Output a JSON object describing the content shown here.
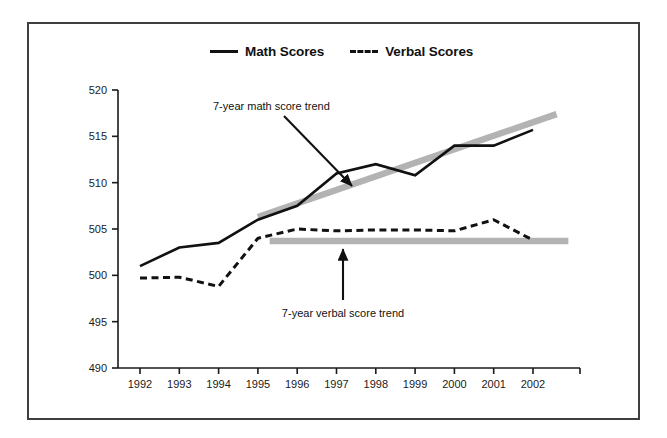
{
  "figure": {
    "border_color": "#3f3f42",
    "background": "#ffffff"
  },
  "legend": {
    "position": "top-center",
    "entries": [
      {
        "label": "Math Scores",
        "marker": "solid-line-swatch",
        "color": "#111111"
      },
      {
        "label": "Verbal Scores",
        "marker": "dashed-line-swatch",
        "color": "#111111"
      }
    ]
  },
  "annotations": [
    {
      "text": "7-year math score trend",
      "target": "math-trend-line"
    },
    {
      "text": "7-year verbal score trend",
      "target": "verbal-trend-line"
    }
  ],
  "axes": {
    "y_ticks": [
      "520",
      "515",
      "510",
      "505",
      "500",
      "495",
      "490"
    ],
    "x_ticks": [
      "1992",
      "1993",
      "1994",
      "1995",
      "1996",
      "1997",
      "1998",
      "1999",
      "2000",
      "2001",
      "2002"
    ]
  },
  "chart_data": {
    "type": "line",
    "title": "",
    "xlabel": "",
    "ylabel": "",
    "categories": [
      "1992",
      "1993",
      "1994",
      "1995",
      "1996",
      "1997",
      "1998",
      "1999",
      "2000",
      "2001",
      "2002"
    ],
    "x": [
      1992,
      1993,
      1994,
      1995,
      1996,
      1997,
      1998,
      1999,
      2000,
      2001,
      2002
    ],
    "ylim": [
      490,
      520
    ],
    "ytick_step": 5,
    "xlim": [
      1992,
      2002
    ],
    "grid": false,
    "legend_position": "top-center",
    "series": [
      {
        "name": "Math Scores",
        "style": "solid",
        "color": "#111111",
        "values": [
          501,
          503,
          503.5,
          506,
          507.5,
          511,
          512,
          510.8,
          514,
          514,
          515.7
        ]
      },
      {
        "name": "Verbal Scores",
        "style": "dashed",
        "color": "#111111",
        "values": [
          499.7,
          499.8,
          498.8,
          504,
          505,
          504.8,
          504.9,
          504.9,
          504.8,
          506,
          503.8
        ]
      }
    ],
    "trend_lines": [
      {
        "name": "7-year math score trend",
        "color": "#b3b3b3",
        "style": "thick-solid",
        "x_start": 1995,
        "x_end": 2002.6,
        "y_start": 506.3,
        "y_end": 517.4
      },
      {
        "name": "7-year verbal score trend",
        "color": "#b3b3b3",
        "style": "thick-solid",
        "x_start": 1995.3,
        "x_end": 2002.9,
        "y_start": 503.7,
        "y_end": 503.7
      }
    ]
  }
}
